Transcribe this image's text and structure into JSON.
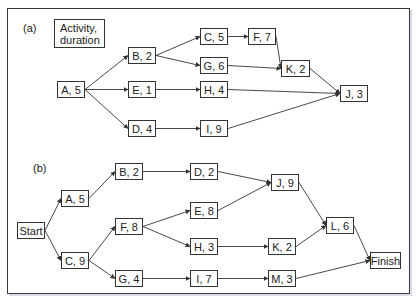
{
  "diagram_a": {
    "label": "(a)",
    "legend": "Activity,\nduration",
    "nodes": [
      {
        "id": "A",
        "text": "A, 5",
        "x": 57,
        "y": 81,
        "w": 28,
        "h": 17
      },
      {
        "id": "B",
        "text": "B, 2",
        "x": 128,
        "y": 47,
        "w": 28,
        "h": 17
      },
      {
        "id": "E",
        "text": "E, 1",
        "x": 128,
        "y": 81,
        "w": 28,
        "h": 17
      },
      {
        "id": "D",
        "text": "D, 4",
        "x": 128,
        "y": 120,
        "w": 28,
        "h": 17
      },
      {
        "id": "C",
        "text": "C, 5",
        "x": 200,
        "y": 28,
        "w": 28,
        "h": 17
      },
      {
        "id": "G",
        "text": "G, 6",
        "x": 200,
        "y": 57,
        "w": 28,
        "h": 17
      },
      {
        "id": "H",
        "text": "H, 4",
        "x": 200,
        "y": 81,
        "w": 28,
        "h": 17
      },
      {
        "id": "I",
        "text": "I, 9",
        "x": 200,
        "y": 120,
        "w": 28,
        "h": 17
      },
      {
        "id": "F",
        "text": "F, 7",
        "x": 248,
        "y": 28,
        "w": 28,
        "h": 17
      },
      {
        "id": "K",
        "text": "K, 2",
        "x": 281,
        "y": 60,
        "w": 29,
        "h": 17
      },
      {
        "id": "J",
        "text": "J, 3",
        "x": 340,
        "y": 85,
        "w": 28,
        "h": 17
      }
    ],
    "edges": [
      [
        "A",
        "B"
      ],
      [
        "A",
        "E"
      ],
      [
        "A",
        "D"
      ],
      [
        "B",
        "C"
      ],
      [
        "B",
        "G"
      ],
      [
        "E",
        "H"
      ],
      [
        "D",
        "I"
      ],
      [
        "C",
        "F"
      ],
      [
        "F",
        "K"
      ],
      [
        "G",
        "K"
      ],
      [
        "K",
        "J"
      ],
      [
        "H",
        "J"
      ],
      [
        "I",
        "J"
      ]
    ]
  },
  "diagram_b": {
    "label": "(b)",
    "nodes": [
      {
        "id": "Start",
        "text": "Start",
        "x": 17,
        "y": 222,
        "w": 28,
        "h": 17
      },
      {
        "id": "A",
        "text": "A, 5",
        "x": 61,
        "y": 190,
        "w": 28,
        "h": 17
      },
      {
        "id": "C",
        "text": "C, 9",
        "x": 61,
        "y": 252,
        "w": 28,
        "h": 17
      },
      {
        "id": "B",
        "text": "B, 2",
        "x": 115,
        "y": 163,
        "w": 28,
        "h": 17
      },
      {
        "id": "F",
        "text": "F, 8",
        "x": 115,
        "y": 218,
        "w": 28,
        "h": 17
      },
      {
        "id": "G",
        "text": "G, 4",
        "x": 115,
        "y": 270,
        "w": 28,
        "h": 17
      },
      {
        "id": "D",
        "text": "D, 2",
        "x": 190,
        "y": 163,
        "w": 28,
        "h": 17
      },
      {
        "id": "E",
        "text": "E, 8",
        "x": 190,
        "y": 202,
        "w": 28,
        "h": 17
      },
      {
        "id": "H",
        "text": "H, 3",
        "x": 190,
        "y": 238,
        "w": 28,
        "h": 17
      },
      {
        "id": "I",
        "text": "I, 7",
        "x": 190,
        "y": 270,
        "w": 28,
        "h": 17
      },
      {
        "id": "J",
        "text": "J, 9",
        "x": 271,
        "y": 174,
        "w": 28,
        "h": 17
      },
      {
        "id": "K",
        "text": "K, 2",
        "x": 268,
        "y": 238,
        "w": 28,
        "h": 17
      },
      {
        "id": "M",
        "text": "M, 3",
        "x": 268,
        "y": 270,
        "w": 28,
        "h": 17
      },
      {
        "id": "L",
        "text": "L, 6",
        "x": 326,
        "y": 217,
        "w": 28,
        "h": 17
      },
      {
        "id": "Finish",
        "text": "Finish",
        "x": 370,
        "y": 252,
        "w": 31,
        "h": 17
      }
    ],
    "edges": [
      [
        "Start",
        "A"
      ],
      [
        "Start",
        "C"
      ],
      [
        "A",
        "B"
      ],
      [
        "C",
        "F"
      ],
      [
        "C",
        "G"
      ],
      [
        "B",
        "D"
      ],
      [
        "F",
        "E"
      ],
      [
        "F",
        "H"
      ],
      [
        "G",
        "I"
      ],
      [
        "D",
        "J"
      ],
      [
        "E",
        "J"
      ],
      [
        "H",
        "K"
      ],
      [
        "I",
        "M"
      ],
      [
        "J",
        "L"
      ],
      [
        "K",
        "L"
      ],
      [
        "L",
        "Finish"
      ],
      [
        "M",
        "Finish"
      ]
    ]
  },
  "colors": {
    "line": "#333333",
    "box_border": "#333333",
    "frame": "#3a3a3a",
    "text": "#222222"
  }
}
